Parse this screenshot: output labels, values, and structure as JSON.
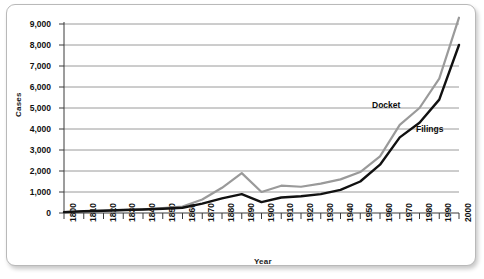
{
  "chart_data": {
    "type": "line",
    "title": "",
    "xlabel": "Year",
    "ylabel": "Cases",
    "xlim": [
      1800,
      2000
    ],
    "ylim": [
      0,
      9000
    ],
    "grid": true,
    "legend_position": "inline-annotation",
    "categories": [
      1800,
      1810,
      1820,
      1830,
      1840,
      1850,
      1860,
      1870,
      1880,
      1890,
      1900,
      1910,
      1920,
      1930,
      1940,
      1950,
      1960,
      1970,
      1980,
      1990,
      2000
    ],
    "xtick_labels": [
      "1800",
      "1810",
      "1820",
      "1830",
      "1840",
      "1850",
      "1860",
      "1870",
      "1880",
      "1890",
      "1900",
      "1910",
      "1920",
      "1930",
      "1940",
      "1950",
      "1960",
      "1970",
      "1980",
      "1990",
      "2000"
    ],
    "ytick_labels": [
      "0",
      "1,000",
      "2,000",
      "3,000",
      "4,000",
      "5,000",
      "6,000",
      "7,000",
      "8,000",
      "9,000"
    ],
    "ytick_values": [
      0,
      1000,
      2000,
      3000,
      4000,
      5000,
      6000,
      7000,
      8000,
      9000
    ],
    "series": [
      {
        "name": "Docket",
        "color": "#9a9a9a",
        "values": [
          40,
          80,
          110,
          140,
          170,
          230,
          310,
          640,
          1200,
          1900,
          1000,
          1300,
          1250,
          1400,
          1600,
          1950,
          2700,
          4200,
          5000,
          6400,
          9300
        ]
      },
      {
        "name": "Filings",
        "color": "#111111",
        "values": [
          40,
          80,
          110,
          140,
          170,
          200,
          250,
          450,
          700,
          900,
          520,
          740,
          800,
          900,
          1100,
          1500,
          2300,
          3600,
          4300,
          5400,
          8000
        ]
      }
    ]
  },
  "axis": {
    "y_title": "Cases",
    "x_title": "Year"
  },
  "annotations": {
    "docket_label": "Docket",
    "filings_label": "Filings"
  }
}
